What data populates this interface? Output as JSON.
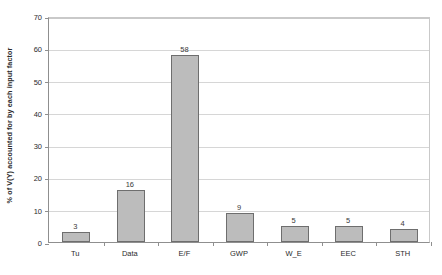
{
  "chart_data": {
    "type": "bar",
    "title": "",
    "subtitle": "",
    "xlabel": "",
    "ylabel": "% of V(Y) accounted for by each input factor",
    "categories": [
      "Tu",
      "Data",
      "E/F",
      "GWP",
      "W_E",
      "EEC",
      "STH"
    ],
    "values": [
      3,
      16,
      58,
      9,
      5,
      5,
      4
    ],
    "value_labels": [
      "3",
      "16",
      "58",
      "9",
      "5",
      "5",
      "4"
    ],
    "ylim": [
      0,
      70
    ],
    "y_ticks": [
      0,
      10,
      20,
      30,
      40,
      50,
      60,
      70
    ],
    "y_tick_labels": [
      "0",
      "10",
      "20",
      "30",
      "40",
      "50",
      "60",
      "70"
    ],
    "grid": "horizontal",
    "legend": "none",
    "legend_position": "none",
    "series": [
      {
        "name": "% of V(Y) accounted for by each input factor",
        "values": [
          3,
          16,
          58,
          9,
          5,
          5,
          4
        ]
      }
    ],
    "colors": {
      "bar_fill": "#bcbcbc",
      "bar_border": "#6e6e6e",
      "gridline": "#d6d6d6",
      "axis": "#8f8f8f",
      "text": "#2b2b2b",
      "background": "#ffffff"
    }
  }
}
